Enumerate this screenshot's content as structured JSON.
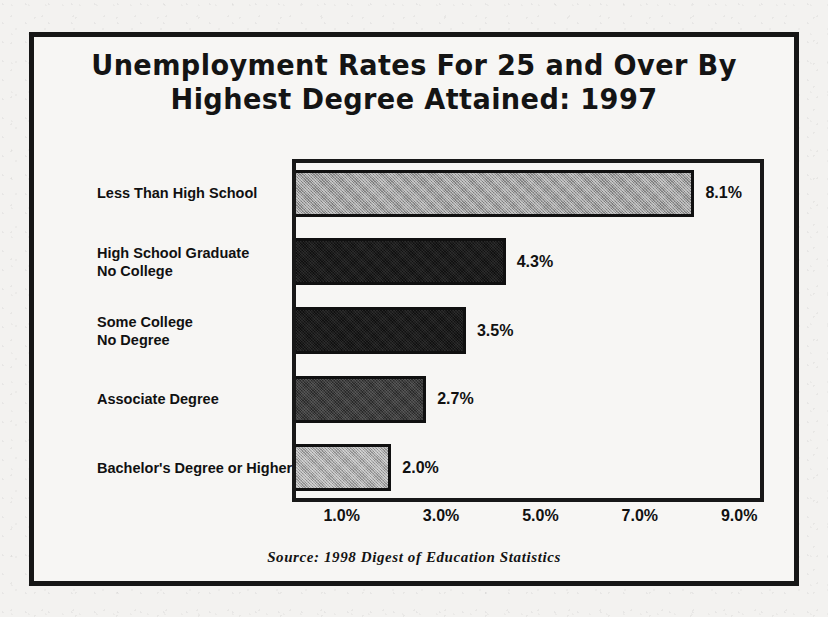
{
  "figure": {
    "title_lines": [
      "Unemployment Rates For 25 and Over By",
      "Highest Degree Attained: 1997"
    ],
    "source_note": "Source:  1998 Digest of Education Statistics",
    "border_color": "#161616",
    "paper_color": "#f3f2f0"
  },
  "chart_data": {
    "type": "bar",
    "orientation": "horizontal",
    "title": "Unemployment Rates For 25 and Over By Highest Degree Attained: 1997",
    "xlabel": "",
    "ylabel": "",
    "categories": [
      "Less Than High School",
      "High School Graduate No College",
      "Some College No Degree",
      "Associate Degree",
      "Bachelor's Degree or Higher"
    ],
    "category_lines": [
      [
        "Less Than High School"
      ],
      [
        "High School Graduate",
        "No College"
      ],
      [
        "Some College",
        "No Degree"
      ],
      [
        "Associate Degree"
      ],
      [
        "Bachelor's Degree or Higher"
      ]
    ],
    "values": [
      8.1,
      4.3,
      3.5,
      2.7,
      2.0
    ],
    "value_labels": [
      "8.1%",
      "4.3%",
      "3.5%",
      "2.7%",
      "2.0%"
    ],
    "bar_fills": [
      "fill-light",
      "fill-darkest",
      "fill-darkest",
      "fill-mid-dark",
      "fill-lighter"
    ],
    "bar_colors": [
      "#9a9a9a",
      "#1b1b1b",
      "#1b1b1b",
      "#3c3c3c",
      "#a6a6a6"
    ],
    "xlim": [
      0.0,
      9.5
    ],
    "xticks": [
      1.0,
      3.0,
      5.0,
      7.0,
      9.0
    ],
    "xtick_labels": [
      "1.0%",
      "3.0%",
      "5.0%",
      "7.0%",
      "9.0%"
    ],
    "grid": false,
    "legend": false,
    "source": "1998 Digest of Education Statistics"
  }
}
